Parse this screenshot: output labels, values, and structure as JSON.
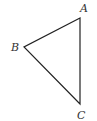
{
  "diagram": {
    "type": "triangle",
    "vertices": [
      {
        "label": "A",
        "x": 80,
        "y": 18,
        "label_x": 80,
        "label_y": 12
      },
      {
        "label": "B",
        "x": 24,
        "y": 47,
        "label_x": 11,
        "label_y": 51
      },
      {
        "label": "C",
        "x": 80,
        "y": 104,
        "label_x": 77,
        "label_y": 119
      }
    ],
    "stroke_color": "#222222",
    "label_color": "#333333"
  }
}
